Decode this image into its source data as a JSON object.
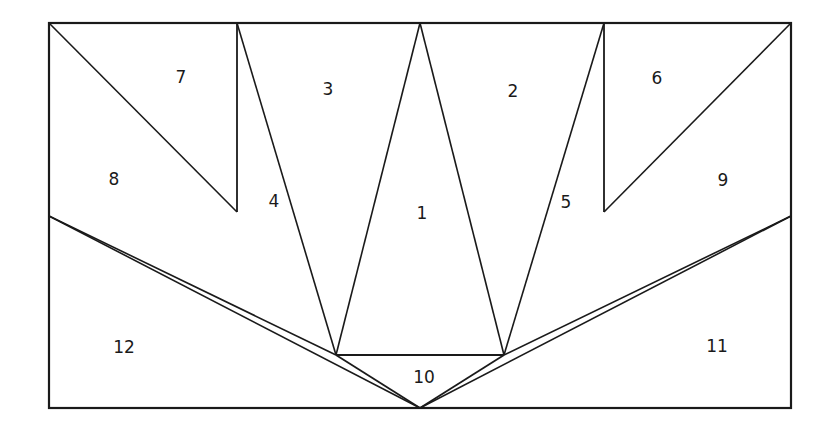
{
  "figure": {
    "canvas": {
      "width": 835,
      "height": 429
    },
    "colors": {
      "background": "#ffffff",
      "stroke": "#1a1a1a",
      "label": "#1a1a1a"
    },
    "frame": {
      "left": 49,
      "top": 23,
      "right": 791,
      "bottom": 408,
      "stroke_width": 2.2
    },
    "geometry": {
      "apex": {
        "x": 420,
        "y": 408
      },
      "bar_left": {
        "x": 336,
        "y": 355
      },
      "bar_right": {
        "x": 504,
        "y": 355
      },
      "top_peak": {
        "x": 420,
        "y": 23
      },
      "left_vertical_x": 237,
      "right_vertical_x": 604,
      "left_vertical_bottom_y": 212,
      "right_vertical_bottom_y": 212,
      "left_edge_split_y": 216,
      "right_edge_split_y": 216,
      "left_v_vertex": {
        "x": 334,
        "y": 216
      },
      "right_v_vertex": {
        "x": 506,
        "y": 216
      }
    },
    "segments": [
      {
        "name": "top-left-diagonal-to-vertical",
        "x1": 49,
        "y1": 23,
        "x2": 237,
        "y2": 212,
        "stroke_width": 1.6
      },
      {
        "name": "top-right-diagonal-to-vertical",
        "x1": 791,
        "y1": 23,
        "x2": 604,
        "y2": 212,
        "stroke_width": 1.6
      },
      {
        "name": "left-vertical",
        "x1": 237,
        "y1": 23,
        "x2": 237,
        "y2": 212,
        "stroke_width": 1.8
      },
      {
        "name": "right-vertical",
        "x1": 604,
        "y1": 23,
        "x2": 604,
        "y2": 212,
        "stroke_width": 1.8
      },
      {
        "name": "ray-left-outer",
        "x1": 49,
        "y1": 216,
        "x2": 336,
        "y2": 355,
        "stroke_width": 1.6
      },
      {
        "name": "ray-right-outer",
        "x1": 791,
        "y1": 216,
        "x2": 504,
        "y2": 355,
        "stroke_width": 1.6
      },
      {
        "name": "ray-left-mid",
        "x1": 237,
        "y1": 23,
        "x2": 336,
        "y2": 355,
        "stroke_width": 1.6
      },
      {
        "name": "ray-right-mid",
        "x1": 604,
        "y1": 23,
        "x2": 504,
        "y2": 355,
        "stroke_width": 1.6
      },
      {
        "name": "ray-left-inner",
        "x1": 420,
        "y1": 23,
        "x2": 336,
        "y2": 355,
        "stroke_width": 1.6
      },
      {
        "name": "ray-right-inner",
        "x1": 420,
        "y1": 23,
        "x2": 504,
        "y2": 355,
        "stroke_width": 1.6
      },
      {
        "name": "horizontal-bar",
        "x1": 336,
        "y1": 355,
        "x2": 504,
        "y2": 355,
        "stroke_width": 1.8
      },
      {
        "name": "apex-left-side",
        "x1": 336,
        "y1": 355,
        "x2": 420,
        "y2": 408,
        "stroke_width": 1.8
      },
      {
        "name": "apex-right-side",
        "x1": 504,
        "y1": 355,
        "x2": 420,
        "y2": 408,
        "stroke_width": 1.8
      },
      {
        "name": "apex-ray-to-left-outer",
        "x1": 420,
        "y1": 408,
        "x2": 49,
        "y2": 216,
        "stroke_width": 1.6
      },
      {
        "name": "apex-ray-to-right-outer",
        "x1": 420,
        "y1": 408,
        "x2": 791,
        "y2": 216,
        "stroke_width": 1.6
      }
    ],
    "regions": [
      {
        "id": "region-1",
        "label": "1",
        "x": 422,
        "y": 214
      },
      {
        "id": "region-2",
        "label": "2",
        "x": 513,
        "y": 92
      },
      {
        "id": "region-3",
        "label": "3",
        "x": 328,
        "y": 90
      },
      {
        "id": "region-4",
        "label": "4",
        "x": 274,
        "y": 202
      },
      {
        "id": "region-5",
        "label": "5",
        "x": 566,
        "y": 203
      },
      {
        "id": "region-6",
        "label": "6",
        "x": 657,
        "y": 79
      },
      {
        "id": "region-7",
        "label": "7",
        "x": 181,
        "y": 78
      },
      {
        "id": "region-8",
        "label": "8",
        "x": 114,
        "y": 180
      },
      {
        "id": "region-9",
        "label": "9",
        "x": 723,
        "y": 181
      },
      {
        "id": "region-10",
        "label": "10",
        "x": 424,
        "y": 378
      },
      {
        "id": "region-11",
        "label": "11",
        "x": 717,
        "y": 347
      },
      {
        "id": "region-12",
        "label": "12",
        "x": 124,
        "y": 348
      }
    ]
  }
}
